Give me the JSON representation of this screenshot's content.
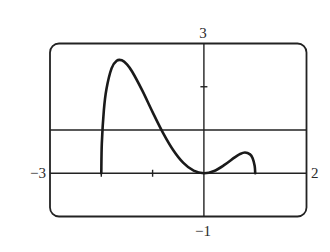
{
  "chart_data": {
    "type": "line",
    "title": "",
    "xlabel": "",
    "ylabel": "",
    "xlim": [
      -3,
      2
    ],
    "ylim": [
      -1,
      3
    ],
    "grid": false,
    "x_ticks": [
      -2,
      -1
    ],
    "y_ticks": [
      2
    ],
    "horizontal_lines": [
      1
    ],
    "window_labels": {
      "xmin": "−3",
      "xmax": "2",
      "ymin": "−1",
      "ymax": "3"
    },
    "series": [
      {
        "name": "f(x)",
        "x": [
          -2,
          -1.99,
          -1.95,
          -1.9,
          -1.8,
          -1.7,
          -1.6,
          -1.5,
          -1.4,
          -1.2,
          -1.0,
          -0.8,
          -0.6,
          -0.4,
          -0.2,
          0,
          0.2,
          0.4,
          0.6,
          0.7,
          0.8,
          0.9,
          0.95,
          0.99,
          1.0
        ],
        "y": [
          0,
          0.685,
          1.46,
          1.944,
          2.425,
          2.601,
          2.611,
          2.516,
          2.352,
          1.91,
          1.414,
          0.941,
          0.539,
          0.239,
          0.059,
          0,
          0.053,
          0.192,
          0.367,
          0.441,
          0.479,
          0.436,
          0.347,
          0.169,
          0
        ]
      }
    ]
  }
}
